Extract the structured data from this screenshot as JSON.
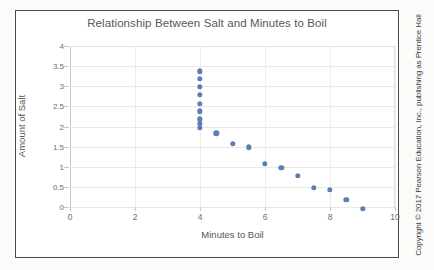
{
  "figure": {
    "copyright": "Copyright © 2017 Pearson Education, Inc., publishing as Prentice Hall",
    "border_color": "#4a4a4a",
    "background": "#ffffff"
  },
  "chart_data": {
    "type": "scatter",
    "title": "Relationship Between Salt and Minutes to Boil",
    "xlabel": "Minutes to Boil",
    "ylabel": "Amount of Salt",
    "xlim": [
      0,
      10
    ],
    "ylim": [
      0,
      4
    ],
    "xticks": [
      0,
      2,
      4,
      6,
      8,
      10
    ],
    "xtick_labels": [
      "0",
      "2",
      "4",
      "6",
      "8",
      "10"
    ],
    "yticks": [
      0,
      0.5,
      1,
      1.5,
      2,
      2.5,
      3,
      3.5,
      4
    ],
    "ytick_labels": [
      "0",
      "0.5",
      "1",
      "1.5",
      "2",
      "2.5",
      "3",
      "3.5",
      "4"
    ],
    "grid": true,
    "grid_axis": "both",
    "legend": false,
    "marker_color": "#5b7fb5",
    "marker_size": 5.4,
    "series": [
      {
        "name": "Salt vs Boil Time",
        "points": [
          {
            "x": 4.0,
            "y": 3.37
          },
          {
            "x": 4.0,
            "y": 3.19
          },
          {
            "x": 4.0,
            "y": 2.98
          },
          {
            "x": 4.0,
            "y": 2.78
          },
          {
            "x": 4.0,
            "y": 2.57
          },
          {
            "x": 4.0,
            "y": 2.38
          },
          {
            "x": 4.0,
            "y": 2.18
          },
          {
            "x": 4.0,
            "y": 2.06
          },
          {
            "x": 4.0,
            "y": 1.97
          },
          {
            "x": 4.5,
            "y": 1.83
          },
          {
            "x": 5.0,
            "y": 1.57
          },
          {
            "x": 5.5,
            "y": 1.48
          },
          {
            "x": 6.0,
            "y": 1.08
          },
          {
            "x": 6.5,
            "y": 0.98
          },
          {
            "x": 7.0,
            "y": 0.78
          },
          {
            "x": 7.5,
            "y": 0.48
          },
          {
            "x": 8.0,
            "y": 0.42
          },
          {
            "x": 8.5,
            "y": 0.18
          },
          {
            "x": 9.0,
            "y": -0.04
          }
        ]
      }
    ]
  }
}
